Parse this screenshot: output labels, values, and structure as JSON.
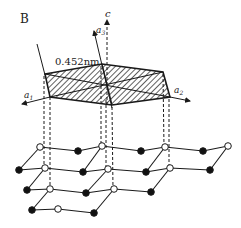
{
  "figure": {
    "panel_label": "B",
    "distance_label": "0.452nm",
    "axes": {
      "c": "c",
      "a1": "a",
      "a1_sub": "1",
      "a2": "a",
      "a2_sub": "2",
      "a3": "a",
      "a3_sub": "3"
    },
    "colors": {
      "line": "#1a1a1a",
      "filled_node": "#111111",
      "open_node": "#ffffff",
      "background": "#ffffff"
    },
    "legend_nodes": {
      "open": "open-circle-node",
      "filled": "filled-circle-node"
    }
  }
}
